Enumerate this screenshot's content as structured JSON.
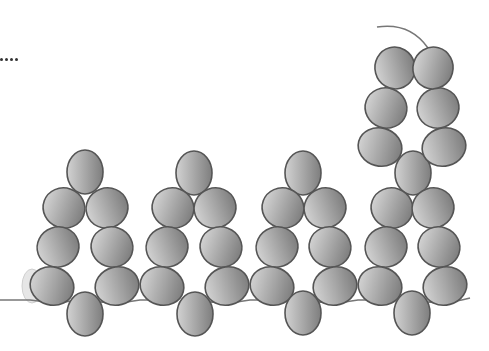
{
  "diagram": {
    "type": "beadwork-pattern",
    "colors": {
      "background": "#ffffff",
      "bead_light": "#d2d2d2",
      "bead_mid": "#a8a8a8",
      "bead_dark": "#7e7e7e",
      "bead_outline": "#555555",
      "thread": "#777777",
      "faded_bead": "#e6e6e6"
    },
    "ellipsis_dots": 4,
    "motif_centers_x": [
      85,
      194,
      303,
      412
    ],
    "beads": [
      {
        "id": "m1-top",
        "cx": 85,
        "cy": 172,
        "rx": 18,
        "ry": 22,
        "rot": 0
      },
      {
        "id": "m1-r2-l",
        "cx": 64,
        "cy": 208,
        "rx": 21,
        "ry": 20,
        "rot": 20
      },
      {
        "id": "m1-r2-r",
        "cx": 107,
        "cy": 208,
        "rx": 21,
        "ry": 20,
        "rot": -20
      },
      {
        "id": "m1-r3-l",
        "cx": 58,
        "cy": 247,
        "rx": 21,
        "ry": 20,
        "rot": -20
      },
      {
        "id": "m1-r3-r",
        "cx": 112,
        "cy": 247,
        "rx": 21,
        "ry": 20,
        "rot": 20
      },
      {
        "id": "m1-r4-l",
        "cx": 52,
        "cy": 286,
        "rx": 22,
        "ry": 19,
        "rot": 15
      },
      {
        "id": "m1-r4-r",
        "cx": 117,
        "cy": 286,
        "rx": 22,
        "ry": 19,
        "rot": -15
      },
      {
        "id": "m1-bottom",
        "cx": 85,
        "cy": 314,
        "rx": 18,
        "ry": 22,
        "rot": 0
      },
      {
        "id": "m2-top",
        "cx": 194,
        "cy": 173,
        "rx": 18,
        "ry": 22,
        "rot": 0
      },
      {
        "id": "m2-r2-l",
        "cx": 173,
        "cy": 208,
        "rx": 21,
        "ry": 20,
        "rot": 20
      },
      {
        "id": "m2-r2-r",
        "cx": 215,
        "cy": 208,
        "rx": 21,
        "ry": 20,
        "rot": -20
      },
      {
        "id": "m2-r3-l",
        "cx": 167,
        "cy": 247,
        "rx": 21,
        "ry": 20,
        "rot": -20
      },
      {
        "id": "m2-r3-r",
        "cx": 221,
        "cy": 247,
        "rx": 21,
        "ry": 20,
        "rot": 20
      },
      {
        "id": "m2-r4-l",
        "cx": 162,
        "cy": 286,
        "rx": 22,
        "ry": 19,
        "rot": 15
      },
      {
        "id": "m2-r4-r",
        "cx": 227,
        "cy": 286,
        "rx": 22,
        "ry": 19,
        "rot": -15
      },
      {
        "id": "m2-bottom",
        "cx": 195,
        "cy": 314,
        "rx": 18,
        "ry": 22,
        "rot": 0
      },
      {
        "id": "m3-top",
        "cx": 303,
        "cy": 173,
        "rx": 18,
        "ry": 22,
        "rot": 0
      },
      {
        "id": "m3-r2-l",
        "cx": 283,
        "cy": 208,
        "rx": 21,
        "ry": 20,
        "rot": 20
      },
      {
        "id": "m3-r2-r",
        "cx": 325,
        "cy": 208,
        "rx": 21,
        "ry": 20,
        "rot": -20
      },
      {
        "id": "m3-r3-l",
        "cx": 277,
        "cy": 247,
        "rx": 21,
        "ry": 20,
        "rot": -20
      },
      {
        "id": "m3-r3-r",
        "cx": 330,
        "cy": 247,
        "rx": 21,
        "ry": 20,
        "rot": 20
      },
      {
        "id": "m3-r4-l",
        "cx": 272,
        "cy": 286,
        "rx": 22,
        "ry": 19,
        "rot": 15
      },
      {
        "id": "m3-r4-r",
        "cx": 335,
        "cy": 286,
        "rx": 22,
        "ry": 19,
        "rot": -15
      },
      {
        "id": "m3-bottom",
        "cx": 303,
        "cy": 313,
        "rx": 18,
        "ry": 22,
        "rot": 0
      },
      {
        "id": "m4-top",
        "cx": 413,
        "cy": 173,
        "rx": 18,
        "ry": 22,
        "rot": 0
      },
      {
        "id": "m4-r2-l",
        "cx": 392,
        "cy": 208,
        "rx": 21,
        "ry": 20,
        "rot": 20
      },
      {
        "id": "m4-r2-r",
        "cx": 433,
        "cy": 208,
        "rx": 21,
        "ry": 20,
        "rot": -20
      },
      {
        "id": "m4-r3-l",
        "cx": 386,
        "cy": 247,
        "rx": 21,
        "ry": 20,
        "rot": -20
      },
      {
        "id": "m4-r3-r",
        "cx": 439,
        "cy": 247,
        "rx": 21,
        "ry": 20,
        "rot": 20
      },
      {
        "id": "m4-r4-l",
        "cx": 380,
        "cy": 286,
        "rx": 22,
        "ry": 19,
        "rot": 15
      },
      {
        "id": "m4-r4-r",
        "cx": 445,
        "cy": 286,
        "rx": 22,
        "ry": 19,
        "rot": -15
      },
      {
        "id": "m4-bottom",
        "cx": 412,
        "cy": 313,
        "rx": 18,
        "ry": 22,
        "rot": 0
      },
      {
        "id": "m5-r3-l",
        "cx": 380,
        "cy": 147,
        "rx": 22,
        "ry": 19,
        "rot": 15
      },
      {
        "id": "m5-r3-r",
        "cx": 444,
        "cy": 147,
        "rx": 22,
        "ry": 19,
        "rot": -15
      },
      {
        "id": "m5-r2-l",
        "cx": 386,
        "cy": 108,
        "rx": 21,
        "ry": 20,
        "rot": 20
      },
      {
        "id": "m5-r2-r",
        "cx": 438,
        "cy": 108,
        "rx": 21,
        "ry": 20,
        "rot": -20
      },
      {
        "id": "m5-r1-l",
        "cx": 395,
        "cy": 68,
        "rx": 20,
        "ry": 21,
        "rot": -15
      },
      {
        "id": "m5-r1-r",
        "cx": 433,
        "cy": 68,
        "rx": 20,
        "ry": 21,
        "rot": 15
      }
    ],
    "threads": [
      {
        "id": "bottom-thread",
        "d": "M 0 300 L 30 300 Q 60 304 70 301 M 100 302 Q 120 304 140 300 L 150 300 M 210 302 Q 230 304 250 300 L 258 300 M 318 302 Q 338 304 358 300 L 366 300 M 428 302 Q 448 304 470 298"
      },
      {
        "id": "tail-thread",
        "d": "M 377 27 Q 410 22 428 48"
      }
    ],
    "faded_bead": {
      "cx": 32,
      "cy": 286,
      "rx": 10,
      "ry": 17
    }
  }
}
